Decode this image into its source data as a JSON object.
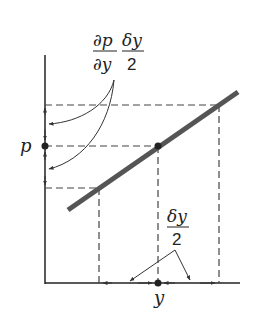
{
  "diagram": {
    "labels": {
      "p_axis": "p",
      "y_axis": "y",
      "gradient_numerator": "∂p",
      "gradient_denominator": "∂y",
      "half_dy_numerator": "δy",
      "half_dy_denominator": "2",
      "bottom_half_dy_numerator": "δy",
      "bottom_half_dy_denominator": "2"
    },
    "colors": {
      "line": "#555555",
      "axis": "#222222",
      "dashed": "#444444"
    }
  }
}
